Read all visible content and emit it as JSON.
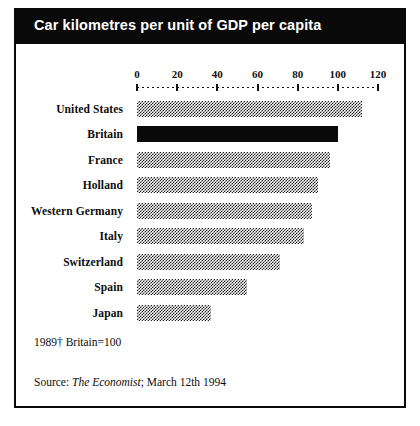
{
  "figure": {
    "title": "Car kilometres per unit of GDP per capita",
    "footnote_basis": "1989†  Britain=100",
    "source_prefix": "Source: ",
    "source_publication": "The Economist",
    "source_suffix": "; March 12th 1994"
  },
  "colors": {
    "title_bar_background": "#0a0a0a",
    "title_text": "#ffffff",
    "frame_border": "#0a0a0a",
    "bar_fill": "#1d1d1d",
    "bar_highlight_fill": "#0a0a0a",
    "page_background": "#ffffff"
  },
  "chart_data": {
    "type": "bar",
    "orientation": "horizontal",
    "title": "Car kilometres per unit of GDP per capita",
    "xlabel": "",
    "ylabel": "",
    "xlim": [
      0,
      120
    ],
    "xticks": [
      0,
      20,
      40,
      60,
      80,
      100,
      120
    ],
    "xtick_labels": [
      "0",
      "20",
      "40",
      "60",
      "80",
      "100",
      "120"
    ],
    "grid": false,
    "legend": false,
    "index_note": "Britain=100",
    "year": "1989",
    "categories": [
      "United States",
      "Britain",
      "France",
      "Holland",
      "Western Germany",
      "Italy",
      "Switzerland",
      "Spain",
      "Japan"
    ],
    "values": [
      112,
      100,
      96,
      90,
      87,
      83,
      71,
      55,
      37
    ],
    "highlighted_category": "Britain",
    "bars": [
      {
        "label": "United States",
        "value": 112,
        "style": "hatched"
      },
      {
        "label": "Britain",
        "value": 100,
        "style": "solid"
      },
      {
        "label": "France",
        "value": 96,
        "style": "hatched"
      },
      {
        "label": "Holland",
        "value": 90,
        "style": "hatched"
      },
      {
        "label": "Western Germany",
        "value": 87,
        "style": "hatched"
      },
      {
        "label": "Italy",
        "value": 83,
        "style": "hatched"
      },
      {
        "label": "Switzerland",
        "value": 71,
        "style": "hatched"
      },
      {
        "label": "Spain",
        "value": 55,
        "style": "hatched"
      },
      {
        "label": "Japan",
        "value": 37,
        "style": "hatched"
      }
    ]
  },
  "layout": {
    "plot_left_px": 121,
    "plot_width_px": 241
  }
}
